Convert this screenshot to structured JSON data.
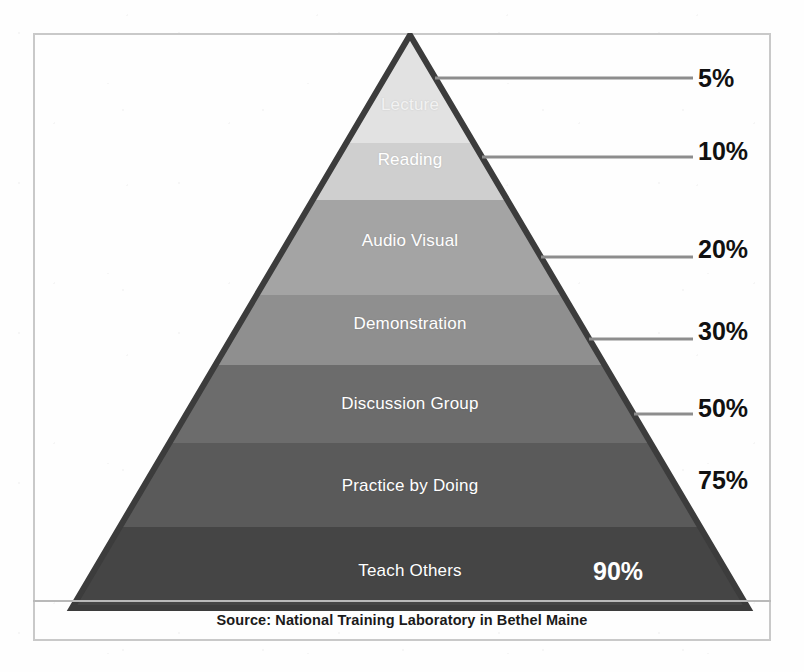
{
  "figure": {
    "source_caption": "Source: National Training Laboratory in Bethel Maine"
  },
  "chart_data": {
    "type": "bar",
    "subtype": "pyramid",
    "title": "",
    "subtitle": "",
    "xlabel": "",
    "ylabel": "Average Retention Rate",
    "orientation": "pyramid-descending",
    "grid": false,
    "legend": false,
    "note": "Learning Pyramid — average learner retention rates by teaching method, lowest retention at the apex to highest at the base.",
    "categories": [
      "Lecture",
      "Reading",
      "Audio Visual",
      "Demonstration",
      "Discussion Group",
      "Practice by Doing",
      "Teach Others"
    ],
    "values": [
      5,
      10,
      20,
      30,
      50,
      75,
      90
    ],
    "value_labels": [
      "5%",
      "10%",
      "20%",
      "30%",
      "50%",
      "75%",
      "90%"
    ],
    "ylim": [
      0,
      100
    ],
    "tiers": [
      {
        "label": "Lecture",
        "value": 5,
        "value_label": "5%",
        "fill": "#e2e2e2",
        "label_color": "#f4f4f4",
        "label_faint": true,
        "has_leader_line": true,
        "pct_inside": false,
        "y_top": 0,
        "y_bottom": 110,
        "label_y": 72,
        "leader_y": 45,
        "pct_y": 45
      },
      {
        "label": "Reading",
        "value": 10,
        "value_label": "10%",
        "fill": "#cfcfcf",
        "label_color": "#ffffff",
        "label_faint": false,
        "has_leader_line": true,
        "pct_inside": false,
        "y_top": 110,
        "y_bottom": 167,
        "label_y": 127,
        "leader_y": 124,
        "pct_y": 118
      },
      {
        "label": "Audio Visual",
        "value": 20,
        "value_label": "20%",
        "fill": "#a4a4a4",
        "label_color": "#ffffff",
        "label_faint": false,
        "has_leader_line": true,
        "pct_inside": false,
        "y_top": 167,
        "y_bottom": 262,
        "label_y": 208,
        "leader_y": 224,
        "pct_y": 216
      },
      {
        "label": "Demonstration",
        "value": 30,
        "value_label": "30%",
        "fill": "#8f8f8f",
        "label_color": "#ffffff",
        "label_faint": false,
        "has_leader_line": true,
        "pct_inside": false,
        "y_top": 262,
        "y_bottom": 332,
        "label_y": 291,
        "leader_y": 306,
        "pct_y": 298
      },
      {
        "label": "Discussion Group",
        "value": 50,
        "value_label": "50%",
        "fill": "#6c6c6c",
        "label_color": "#ffffff",
        "label_faint": false,
        "has_leader_line": true,
        "pct_inside": false,
        "y_top": 332,
        "y_bottom": 410,
        "label_y": 371,
        "leader_y": 381,
        "pct_y": 375
      },
      {
        "label": "Practice by Doing",
        "value": 75,
        "value_label": "75%",
        "fill": "#5a5a5a",
        "label_color": "#ffffff",
        "label_faint": false,
        "has_leader_line": false,
        "pct_inside": false,
        "y_top": 410,
        "y_bottom": 494,
        "label_y": 453,
        "leader_y": null,
        "pct_y": 447
      },
      {
        "label": "Teach Others",
        "value": 90,
        "value_label": "90%",
        "fill": "#454545",
        "label_color": "#ffffff",
        "label_faint": false,
        "has_leader_line": false,
        "pct_inside": true,
        "y_top": 494,
        "y_bottom": 575,
        "label_y": 538,
        "leader_y": null,
        "pct_y": 538
      }
    ]
  },
  "colors": {
    "frame_border": "#c9c9c9",
    "pyramid_outline": "#3c3c3c",
    "leader_line": "#8d8d8d",
    "percent_text": "#111111",
    "percent_inside_text": "#ffffff",
    "caption_text": "#1a1a1a",
    "background": "#ffffff"
  }
}
